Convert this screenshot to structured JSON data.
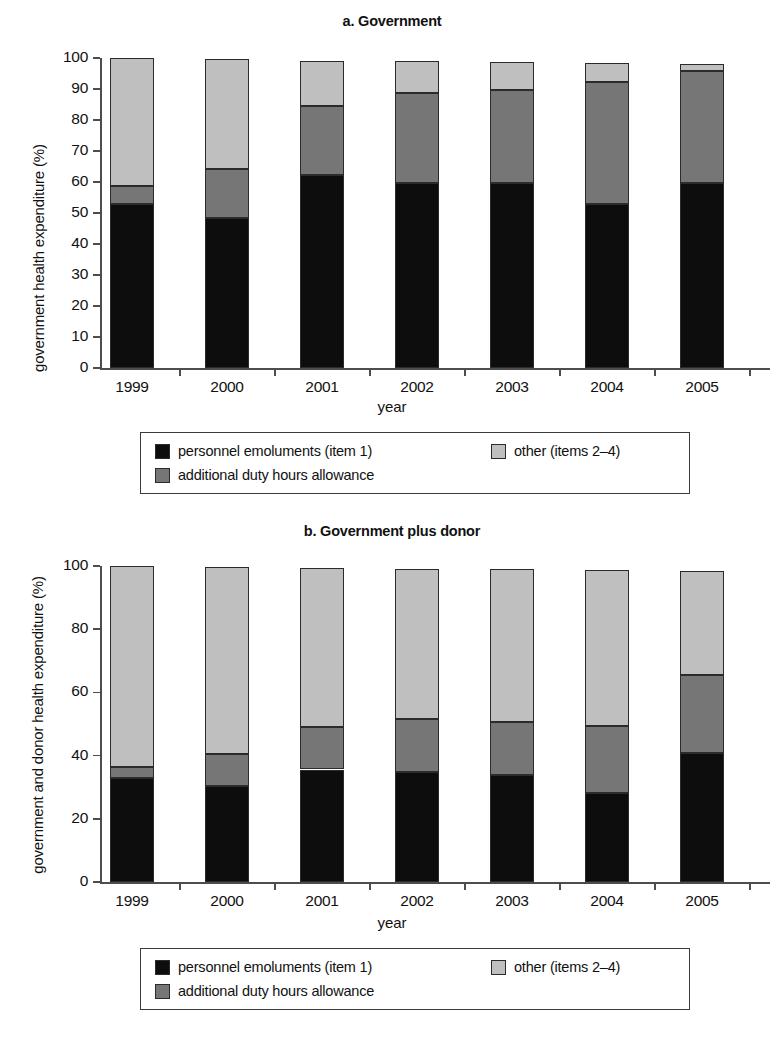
{
  "figure": {
    "axis_name": "year",
    "legend": {
      "items": [
        {
          "key": "personnel",
          "label": "personnel emoluments (item 1)",
          "swatch": "black-swatch-icon"
        },
        {
          "key": "adha",
          "label": "additional duty hours allowance",
          "swatch": "dark-gray-swatch-icon"
        },
        {
          "key": "other",
          "label": "other (items 2–4)",
          "swatch": "light-gray-swatch-icon"
        }
      ]
    },
    "colors": {
      "personnel": "#0d0d0d",
      "adha": "#767676",
      "other": "#bfbfbf"
    }
  },
  "chart_data": [
    {
      "id": "a",
      "type": "bar",
      "subtype": "stacked",
      "title": "a. Government",
      "xlabel": "year",
      "ylabel": "government health expenditure (%)",
      "ylim": [
        0,
        100
      ],
      "yticks": [
        0,
        10,
        20,
        30,
        40,
        50,
        60,
        70,
        80,
        90,
        100
      ],
      "ytick_labels": [
        "0",
        "10",
        "20",
        "30",
        "40",
        "50",
        "60",
        "70",
        "80",
        "90",
        "100"
      ],
      "grid": false,
      "legend_position": "below",
      "categories": [
        "1999",
        "2000",
        "2001",
        "2002",
        "2003",
        "2004",
        "2005"
      ],
      "series": [
        {
          "name": "personnel emoluments (item 1)",
          "values": [
            52.8,
            48.3,
            62.3,
            59.7,
            59.6,
            52.8,
            59.6
          ]
        },
        {
          "name": "additional duty hours allowance",
          "values": [
            5.8,
            16.0,
            22.3,
            28.9,
            30.0,
            39.3,
            36.2
          ]
        },
        {
          "name": "other (items 2–4)",
          "values": [
            41.4,
            35.3,
            14.5,
            10.5,
            9.1,
            6.4,
            2.4
          ]
        }
      ],
      "totals": [
        100.0,
        99.6,
        99.1,
        99.1,
        98.7,
        98.5,
        98.2
      ]
    },
    {
      "id": "b",
      "type": "bar",
      "subtype": "stacked",
      "title": "b. Government plus donor",
      "xlabel": "year",
      "ylabel": "government and donor health expenditure (%)",
      "ylim": [
        0,
        100
      ],
      "yticks": [
        0,
        20,
        40,
        60,
        80,
        100
      ],
      "ytick_labels": [
        "0",
        "20",
        "40",
        "60",
        "80",
        "100"
      ],
      "grid": false,
      "legend_position": "below",
      "categories": [
        "1999",
        "2000",
        "2001",
        "2002",
        "2003",
        "2004",
        "2005"
      ],
      "series": [
        {
          "name": "personnel emoluments (item 1)",
          "values": [
            33.0,
            30.4,
            35.6,
            34.8,
            33.9,
            28.1,
            40.8
          ]
        },
        {
          "name": "additional duty hours allowance",
          "values": [
            3.4,
            10.0,
            13.3,
            16.7,
            16.8,
            21.2,
            24.6
          ]
        },
        {
          "name": "other (items 2–4)",
          "values": [
            63.6,
            59.3,
            50.4,
            47.7,
            48.3,
            49.3,
            33.1
          ]
        }
      ],
      "totals": [
        100.0,
        99.7,
        99.3,
        99.2,
        99.0,
        98.6,
        98.5
      ]
    }
  ]
}
